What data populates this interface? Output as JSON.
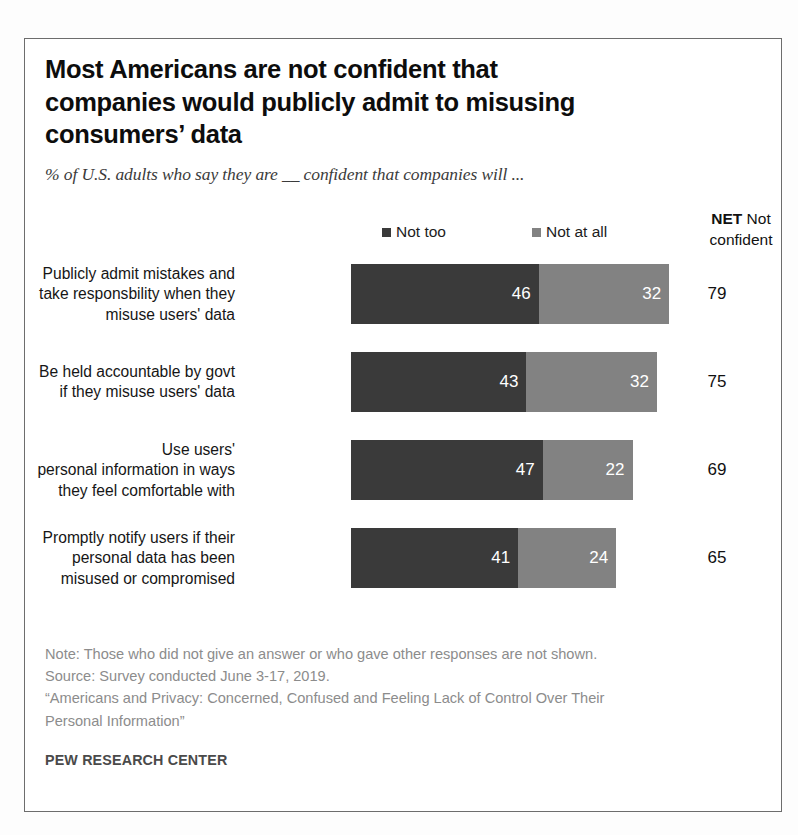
{
  "title": "Most Americans are not confident that companies would publicly admit to misusing consumers’ data",
  "subtitle": "% of U.S. adults who say they are __ confident that companies will ...",
  "net_header": {
    "bold": "NET",
    "rest": " Not confident"
  },
  "legend": [
    {
      "label": "Not too",
      "color": "#3a3a3a"
    },
    {
      "label": "Not at all",
      "color": "#828282"
    }
  ],
  "footer": {
    "note": "Note: Those who did not give an answer or who gave other responses are not shown.",
    "source": "Source: Survey conducted June 3-17, 2019.",
    "report_line1": "“Americans and Privacy: Concerned, Confused and Feeling Lack of Control Over Their",
    "report_line2": "Personal Information”",
    "attribution": "PEW RESEARCH CENTER"
  },
  "chart_data": {
    "type": "bar",
    "orientation": "horizontal",
    "stacked": true,
    "title": "Most Americans are not confident that companies would publicly admit to misusing consumers’ data",
    "subtitle": "% of U.S. adults who say they are __ confident that companies will ...",
    "xlabel": "",
    "ylabel": "",
    "xlim": [
      0,
      100
    ],
    "grid": false,
    "legend_position": "top",
    "value_labels": true,
    "categories": [
      "Publicly admit mistakes and take responsbility when they misuse users' data",
      "Be held accountable by govt if they misuse users' data",
      "Use users' personal information in ways they feel comfortable with",
      "Promptly notify users if their personal data has been misused or compromised"
    ],
    "series": [
      {
        "name": "Not too",
        "color": "#3a3a3a",
        "values": [
          46,
          43,
          47,
          41
        ]
      },
      {
        "name": "Not at all",
        "color": "#828282",
        "values": [
          32,
          32,
          22,
          24
        ]
      }
    ],
    "net": {
      "name": "NET Not confident",
      "values": [
        79,
        75,
        69,
        65
      ]
    }
  },
  "rows": [
    {
      "label_lines": [
        "Publicly admit mistakes and",
        "take responsbility when they",
        "misuse users' data"
      ],
      "not_too": 46,
      "not_at_all": 32,
      "net": 79
    },
    {
      "label_lines": [
        "Be held accountable by govt",
        "if they misuse users' data"
      ],
      "not_too": 43,
      "not_at_all": 32,
      "net": 75
    },
    {
      "label_lines": [
        "Use users'",
        "personal information in ways",
        "they feel comfortable with"
      ],
      "not_too": 47,
      "not_at_all": 22,
      "net": 69
    },
    {
      "label_lines": [
        "Promptly notify users if their",
        "personal data has been",
        "misused or compromised"
      ],
      "not_too": 41,
      "not_at_all": 24,
      "net": 65
    }
  ]
}
